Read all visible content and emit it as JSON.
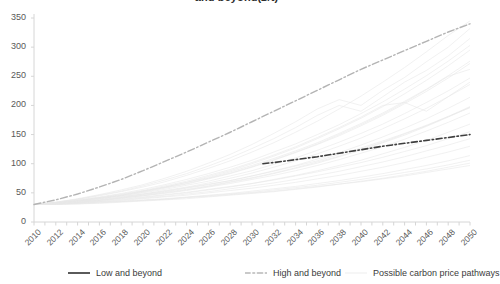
{
  "chart": {
    "title": "and beyond(£/t)",
    "axis_color": "#d6d6d6",
    "tick_text_color": "#595959"
  },
  "legend": {
    "items": [
      {
        "label": "Low and beyond",
        "style": "solid",
        "color": "#5a5a5a",
        "name": "legend-low-and-beyond"
      },
      {
        "label": "High and beyond",
        "style": "dashed",
        "color": "#c9c9c9",
        "name": "legend-high-and-beyond"
      },
      {
        "label": "Possible carbon price pathways",
        "style": "faint",
        "color": "#ededed",
        "name": "legend-possible-pathways"
      }
    ]
  },
  "chart_data": {
    "type": "line",
    "title": "and beyond(£/t)",
    "xlabel": "",
    "ylabel": "",
    "xlim": [
      2010,
      2050
    ],
    "ylim": [
      0,
      350
    ],
    "yticks": [
      0,
      50,
      100,
      150,
      200,
      250,
      300,
      350
    ],
    "xticks": [
      2010,
      2012,
      2014,
      2016,
      2018,
      2020,
      2022,
      2024,
      2026,
      2028,
      2030,
      2032,
      2034,
      2036,
      2038,
      2040,
      2042,
      2044,
      2046,
      2048,
      2050
    ],
    "xtick_minor_step": 1,
    "grid": false,
    "legend_position": "bottom",
    "x": [
      2010,
      2012,
      2014,
      2016,
      2018,
      2020,
      2022,
      2024,
      2026,
      2028,
      2030,
      2032,
      2034,
      2036,
      2038,
      2040,
      2042,
      2044,
      2046,
      2048,
      2050
    ],
    "series": [
      {
        "name": "Low and beyond",
        "style": "dashdot",
        "color": "#3f3f3f",
        "width": 1.6,
        "x": [
          2031,
          2032,
          2034,
          2036,
          2038,
          2040,
          2042,
          2044,
          2046,
          2048,
          2050
        ],
        "values": [
          100,
          102,
          107,
          112,
          118,
          124,
          130,
          135,
          140,
          145,
          150
        ]
      },
      {
        "name": "High and beyond",
        "style": "dashdot",
        "color": "#b4b4b4",
        "width": 1.4,
        "x": [
          2010,
          2012,
          2014,
          2016,
          2018,
          2020,
          2022,
          2024,
          2026,
          2028,
          2030,
          2032,
          2034,
          2036,
          2038,
          2040,
          2042,
          2044,
          2046,
          2048,
          2050
        ],
        "values": [
          30,
          38,
          48,
          60,
          73,
          88,
          104,
          120,
          137,
          154,
          172,
          190,
          208,
          226,
          244,
          262,
          278,
          294,
          310,
          326,
          340
        ]
      },
      {
        "name": "Possible carbon price pathways",
        "style": "solid",
        "color": "#e8e8e8",
        "width": 0.7,
        "count": 24,
        "note": "Faint spaghetti ensemble fanning out from ~30 in 2010 to a spread of roughly 60-345 by 2050",
        "paths": [
          {
            "values": [
              30,
              33,
              37,
              41,
              45,
              50,
              56,
              63,
              70,
              79,
              88,
              99,
              110,
              123,
              137,
              152,
              168,
              186,
              205,
              225,
              247
            ]
          },
          {
            "values": [
              30,
              34,
              39,
              45,
              52,
              60,
              69,
              80,
              92,
              105,
              120,
              136,
              154,
              173,
              194,
              216,
              240,
              265,
              292,
              320,
              345
            ]
          },
          {
            "values": [
              30,
              32,
              35,
              38,
              42,
              46,
              51,
              56,
              62,
              69,
              76,
              84,
              93,
              103,
              113,
              125,
              137,
              151,
              165,
              181,
              198
            ]
          },
          {
            "values": [
              30,
              33,
              36,
              40,
              44,
              48,
              53,
              59,
              65,
              71,
              79,
              87,
              96,
              105,
              116,
              127,
              139,
              152,
              166,
              181,
              196
            ]
          },
          {
            "values": [
              30,
              31,
              33,
              35,
              38,
              41,
              44,
              48,
              52,
              57,
              62,
              67,
              73,
              80,
              87,
              95,
              103,
              112,
              122,
              132,
              143
            ]
          },
          {
            "values": [
              30,
              32,
              34,
              37,
              40,
              43,
              47,
              51,
              56,
              61,
              66,
              72,
              79,
              86,
              94,
              102,
              111,
              121,
              131,
              143,
              155
            ]
          },
          {
            "values": [
              30,
              33,
              37,
              42,
              47,
              53,
              60,
              68,
              76,
              86,
              97,
              109,
              122,
              136,
              152,
              169,
              187,
              207,
              228,
              251,
              276
            ]
          },
          {
            "values": [
              30,
              31,
              32,
              34,
              36,
              38,
              40,
              43,
              46,
              49,
              53,
              57,
              61,
              66,
              71,
              77,
              83,
              90,
              97,
              105,
              114
            ]
          },
          {
            "values": [
              30,
              34,
              40,
              47,
              55,
              64,
              75,
              87,
              101,
              116,
              133,
              152,
              172,
              194,
              210,
              200,
              226,
              248,
              275,
              300,
              332
            ]
          },
          {
            "values": [
              30,
              32,
              35,
              39,
              43,
              48,
              54,
              60,
              67,
              75,
              84,
              94,
              105,
              117,
              130,
              144,
              160,
              177,
              195,
              215,
              236
            ]
          },
          {
            "values": [
              30,
              31,
              33,
              36,
              39,
              42,
              46,
              50,
              55,
              60,
              66,
              73,
              80,
              88,
              97,
              106,
              117,
              128,
              140,
              154,
              168
            ]
          },
          {
            "values": [
              30,
              33,
              38,
              43,
              49,
              56,
              64,
              73,
              83,
              94,
              106,
              120,
              134,
              150,
              167,
              186,
              206,
              228,
              251,
              276,
              303
            ]
          },
          {
            "values": [
              30,
              30,
              31,
              32,
              34,
              36,
              38,
              40,
              43,
              46,
              49,
              52,
              56,
              60,
              65,
              70,
              75,
              81,
              87,
              94,
              101
            ]
          },
          {
            "values": [
              30,
              32,
              36,
              40,
              45,
              51,
              58,
              65,
              74,
              83,
              94,
              106,
              119,
              133,
              148,
              165,
              183,
              203,
              224,
              247,
              272
            ]
          },
          {
            "values": [
              30,
              31,
              34,
              37,
              41,
              45,
              50,
              55,
              61,
              68,
              75,
              83,
              92,
              101,
              112,
              123,
              136,
              149,
              164,
              180,
              197
            ]
          },
          {
            "values": [
              30,
              33,
              37,
              42,
              48,
              54,
              62,
              70,
              80,
              90,
              102,
              115,
              129,
              145,
              162,
              180,
              200,
              205,
              190,
              215,
              240
            ]
          },
          {
            "values": [
              30,
              30,
              31,
              33,
              35,
              37,
              39,
              42,
              45,
              48,
              51,
              55,
              59,
              63,
              68,
              73,
              79,
              85,
              91,
              98,
              106
            ]
          },
          {
            "values": [
              30,
              32,
              35,
              38,
              42,
              47,
              52,
              58,
              64,
              71,
              79,
              88,
              97,
              108,
              119,
              132,
              146,
              161,
              177,
              195,
              214
            ]
          },
          {
            "values": [
              30,
              34,
              39,
              46,
              53,
              62,
              72,
              83,
              96,
              110,
              126,
              143,
              162,
              183,
              200,
              190,
              215,
              240,
              260,
              285,
              315
            ]
          },
          {
            "values": [
              30,
              31,
              33,
              35,
              37,
              40,
              43,
              46,
              50,
              54,
              58,
              63,
              68,
              74,
              80,
              87,
              94,
              102,
              111,
              120,
              130
            ]
          },
          {
            "values": [
              30,
              32,
              34,
              37,
              41,
              45,
              49,
              54,
              60,
              66,
              73,
              80,
              88,
              97,
              107,
              118,
              129,
              142,
              156,
              171,
              187
            ]
          },
          {
            "values": [
              30,
              33,
              36,
              41,
              46,
              52,
              59,
              66,
              75,
              84,
              95,
              107,
              120,
              134,
              150,
              167,
              185,
              205,
              227,
              250,
              262
            ]
          },
          {
            "values": [
              30,
              31,
              32,
              34,
              35,
              37,
              39,
              42,
              44,
              47,
              50,
              53,
              57,
              61,
              65,
              69,
              74,
              79,
              85,
              91,
              97
            ]
          },
          {
            "values": [
              30,
              32,
              36,
              41,
              46,
              53,
              60,
              68,
              78,
              88,
              100,
              113,
              127,
              143,
              160,
              178,
              198,
              220,
              243,
              268,
              295
            ]
          }
        ]
      }
    ]
  }
}
